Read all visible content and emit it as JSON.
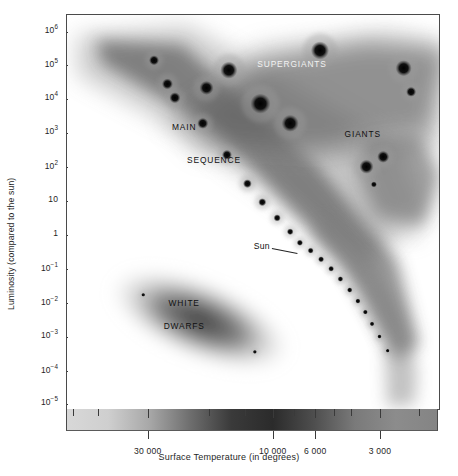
{
  "chart_data": {
    "type": "scatter",
    "title": "",
    "xlabel": "Surface Temperature (in degrees)",
    "ylabel": "Luminosity (compared to the sun)",
    "grid": false,
    "legend_position": "none",
    "x_axis": {
      "scale": "log-reversed",
      "note": "temperature decreases left to right",
      "tick_labels": [
        "30 000",
        "10 000",
        "6 000",
        "3 000"
      ],
      "tick_values": [
        30000,
        10000,
        6000,
        3000
      ],
      "tick_positions_pct": [
        22.0,
        55.6,
        67.0,
        84.4
      ],
      "minor_tick_positions_pct": [
        2.0,
        8.5,
        22.0,
        38.5,
        48.0,
        55.6,
        61.2,
        67.0,
        72.0,
        76.5,
        84.4,
        95.0
      ]
    },
    "y_axis": {
      "scale": "log",
      "tick_labels": [
        "10⁶",
        "10⁵",
        "10⁴",
        "10³",
        "10²",
        "10",
        "1",
        "10⁻¹",
        "10⁻²",
        "10⁻³",
        "10⁻⁴",
        "10⁻⁵"
      ],
      "tick_mantissas": [
        "10",
        "10",
        "10",
        "10",
        "10",
        "10",
        "1",
        "10",
        "10",
        "10",
        "10",
        "10"
      ],
      "tick_exponents": [
        "6",
        "5",
        "4",
        "3",
        "2",
        "",
        "",
        "-1",
        "-2",
        "-3",
        "-4",
        "-5"
      ],
      "tick_values": [
        1000000,
        100000,
        10000,
        1000,
        100,
        10,
        1,
        0.1,
        0.01,
        0.001,
        0.0001,
        1e-05
      ],
      "tick_positions_pct": [
        4.3,
        12.7,
        21.3,
        29.9,
        38.6,
        47.2,
        55.8,
        64.5,
        73.1,
        81.7,
        90.4,
        98.7
      ]
    },
    "regions": [
      {
        "name": "SUPERGIANTS",
        "label_x_pct": 60.5,
        "label_y_pct": 12.5,
        "color": "#f2f2f2"
      },
      {
        "name": "GIANTS",
        "label_x_pct": 79.5,
        "label_y_pct": 30.2,
        "color": "#101010"
      },
      {
        "name": "MAIN",
        "label_x_pct": 31.5,
        "label_y_pct": 28.5,
        "color": "#101010"
      },
      {
        "name": "SEQUENCE",
        "label_x_pct": 39.5,
        "label_y_pct": 36.8,
        "color": "#101010"
      },
      {
        "name": "WHITE",
        "label_x_pct": 31.5,
        "label_y_pct": 73.0,
        "color": "#101010"
      },
      {
        "name": "DWARFS",
        "label_x_pct": 31.5,
        "label_y_pct": 79.0,
        "color": "#101010"
      }
    ],
    "annotations": [
      {
        "text": "Sun",
        "x_pct": 54.5,
        "y_pct": 58.7,
        "points_to_x_pct": 62.0,
        "points_to_y_pct": 60.5
      }
    ],
    "stars": [
      {
        "x_pct": 23.4,
        "y_pct": 11.5,
        "r_px": 5.0,
        "series": "main-sequence"
      },
      {
        "x_pct": 27.0,
        "y_pct": 17.5,
        "r_px": 5.5,
        "series": "main-sequence"
      },
      {
        "x_pct": 29.0,
        "y_pct": 21.0,
        "r_px": 5.5,
        "series": "main-sequence"
      },
      {
        "x_pct": 36.5,
        "y_pct": 27.5,
        "r_px": 5.5,
        "series": "main-sequence"
      },
      {
        "x_pct": 43.0,
        "y_pct": 35.5,
        "r_px": 5.0,
        "series": "main-sequence"
      },
      {
        "x_pct": 48.5,
        "y_pct": 42.8,
        "r_px": 4.4,
        "series": "main-sequence"
      },
      {
        "x_pct": 52.5,
        "y_pct": 47.5,
        "r_px": 4.0,
        "series": "main-sequence"
      },
      {
        "x_pct": 56.5,
        "y_pct": 51.5,
        "r_px": 3.6,
        "series": "main-sequence"
      },
      {
        "x_pct": 60.0,
        "y_pct": 55.0,
        "r_px": 3.3,
        "series": "main-sequence"
      },
      {
        "x_pct": 62.6,
        "y_pct": 57.8,
        "r_px": 3.1,
        "series": "main-sequence"
      },
      {
        "x_pct": 65.5,
        "y_pct": 59.8,
        "r_px": 3.0,
        "series": "main-sequence"
      },
      {
        "x_pct": 68.3,
        "y_pct": 62.0,
        "r_px": 3.0,
        "series": "main-sequence"
      },
      {
        "x_pct": 71.0,
        "y_pct": 64.4,
        "r_px": 2.9,
        "series": "main-sequence"
      },
      {
        "x_pct": 73.5,
        "y_pct": 67.0,
        "r_px": 2.8,
        "series": "main-sequence"
      },
      {
        "x_pct": 76.0,
        "y_pct": 69.8,
        "r_px": 2.7,
        "series": "main-sequence"
      },
      {
        "x_pct": 78.2,
        "y_pct": 72.6,
        "r_px": 2.6,
        "series": "main-sequence"
      },
      {
        "x_pct": 80.2,
        "y_pct": 75.4,
        "r_px": 2.5,
        "series": "main-sequence"
      },
      {
        "x_pct": 82.0,
        "y_pct": 78.4,
        "r_px": 2.4,
        "series": "main-sequence"
      },
      {
        "x_pct": 84.0,
        "y_pct": 81.6,
        "r_px": 2.2,
        "series": "main-sequence"
      },
      {
        "x_pct": 86.2,
        "y_pct": 85.2,
        "r_px": 2.0,
        "series": "main-sequence"
      },
      {
        "x_pct": 43.5,
        "y_pct": 14.0,
        "r_px": 8.5,
        "series": "supergiants"
      },
      {
        "x_pct": 37.5,
        "y_pct": 18.5,
        "r_px": 7.0,
        "series": "supergiants"
      },
      {
        "x_pct": 52.0,
        "y_pct": 22.5,
        "r_px": 10.0,
        "series": "supergiants"
      },
      {
        "x_pct": 60.0,
        "y_pct": 27.5,
        "r_px": 8.5,
        "series": "supergiants"
      },
      {
        "x_pct": 68.0,
        "y_pct": 9.0,
        "r_px": 9.0,
        "series": "supergiants"
      },
      {
        "x_pct": 90.5,
        "y_pct": 13.5,
        "r_px": 8.0,
        "series": "supergiants"
      },
      {
        "x_pct": 92.5,
        "y_pct": 19.5,
        "r_px": 5.0,
        "series": "supergiants"
      },
      {
        "x_pct": 85.0,
        "y_pct": 36.0,
        "r_px": 6.0,
        "series": "giants"
      },
      {
        "x_pct": 80.5,
        "y_pct": 38.5,
        "r_px": 7.0,
        "series": "giants"
      },
      {
        "x_pct": 82.5,
        "y_pct": 43.0,
        "r_px": 3.0,
        "series": "giants"
      },
      {
        "x_pct": 20.5,
        "y_pct": 71.0,
        "r_px": 1.6,
        "series": "white-dwarfs"
      },
      {
        "x_pct": 50.5,
        "y_pct": 85.5,
        "r_px": 1.6,
        "series": "white-dwarfs"
      }
    ],
    "temperature_bar": {
      "description": "horizontal grayscale gradient under x-axis, hot(left) to cool(right)",
      "stops": [
        "#d8d8d8",
        "#cfcfcf",
        "#a8a8a8",
        "#6e6e6e",
        "#3a3a3a",
        "#2b2b2b",
        "#4e4e4e",
        "#7a7a7a",
        "#8c8c8c",
        "#848484"
      ]
    }
  },
  "colors": {
    "frame": "#4a4a4a",
    "text": "#1f1f1f",
    "label_light": "#f2f2f2",
    "label_dark": "#101010",
    "background": "#ffffff"
  }
}
